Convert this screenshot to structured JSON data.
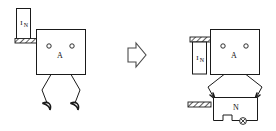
{
  "figure": {
    "background_color": "#ffffff",
    "line_color": "#1a1a1a",
    "width": 276,
    "height": 131
  },
  "labels": {
    "head_label": "A",
    "current_symbol": "I",
    "current_subscript": "N",
    "module_label": "N"
  },
  "left_figure": {
    "name": "before-state",
    "head": {
      "label": "A",
      "x": 36,
      "y": 29,
      "w": 49,
      "h": 45
    },
    "eyes": [
      {
        "cx": 49,
        "cy": 46,
        "r": 2.2
      },
      {
        "cx": 72,
        "cy": 46,
        "r": 2.2
      },
      {
        "name": "left-eye"
      },
      {
        "name": "right-eye"
      }
    ],
    "pillar": {
      "label_symbol": "I",
      "label_sub": "N",
      "x": 16,
      "y": 8,
      "w": 14,
      "h": 32
    },
    "anchor_bar": {
      "x": 15,
      "y": 38,
      "w": 22,
      "h": 5,
      "style": "hatched"
    },
    "legs": "two bent legs with curved claw feet"
  },
  "arrow": {
    "name": "transformation-arrow",
    "direction": "right",
    "color": "#4a4a4a"
  },
  "right_figure": {
    "name": "after-state",
    "head": {
      "label": "A",
      "x": 210,
      "y": 29,
      "w": 49,
      "h": 45
    },
    "eyes": [
      {
        "cx": 223,
        "cy": 46,
        "r": 2.2
      },
      {
        "cx": 246,
        "cy": 46,
        "r": 2.2
      }
    ],
    "pillar": {
      "label_symbol": "I",
      "label_sub": "N",
      "x": 192,
      "y": 42,
      "w": 14,
      "h": 32
    },
    "anchor_bar_top": {
      "x": 190,
      "y": 37,
      "w": 22,
      "h": 5,
      "style": "hatched"
    },
    "anchor_bar_lower": {
      "x": 188,
      "y": 102,
      "w": 22,
      "h": 5,
      "style": "hatched"
    },
    "module_box": {
      "label": "N",
      "x": 213,
      "y": 97,
      "w": 45,
      "h": 24
    },
    "wheel": {
      "cx": 243,
      "cy": 120,
      "r": 3.4,
      "name": "wheel-icon"
    },
    "arms": "two arms reaching down from head to module box corners"
  },
  "annotations": {
    "left_caption": "",
    "right_caption": ""
  }
}
